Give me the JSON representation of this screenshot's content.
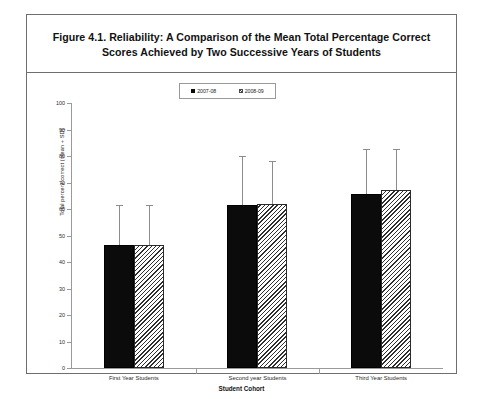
{
  "figure": {
    "title": "Figure 4.1.  Reliability: A Comparison of the Mean Total Percentage Correct Scores Achieved by Two Successive Years of Students",
    "border_color": "#6e6e6e",
    "background": "#ffffff"
  },
  "chart_data": {
    "type": "bar",
    "title": "Figure 4.1.  Reliability: A Comparison of the Mean Total Percentage Correct Scores Achieved by Two Successive Years of Students",
    "xlabel": "Student Cohort",
    "ylabel": "Total percent correct (mean + SD)",
    "categories": [
      "First Year Students",
      "Second year Students",
      "Third Year Students"
    ],
    "ylim": [
      0,
      100
    ],
    "yticks": [
      0,
      10,
      20,
      30,
      40,
      50,
      60,
      70,
      80,
      90,
      100
    ],
    "ytick_labels": [
      "0",
      "10",
      "20",
      "30",
      "40",
      "50",
      "60",
      "70",
      "80",
      "90",
      "100"
    ],
    "grid": false,
    "legend_position": "top-center",
    "error_bars": "SD (upper only)",
    "series": [
      {
        "name": "2007-08",
        "style": "solid-black",
        "color": "#0b0b0b",
        "values": [
          46.5,
          61.5,
          65.5
        ],
        "errors": [
          15.0,
          18.5,
          17.0
        ]
      },
      {
        "name": "2008-09",
        "style": "diagonal-hatch",
        "color": "#ffffff",
        "values": [
          46.5,
          62.0,
          67.0
        ],
        "errors": [
          15.0,
          16.0,
          15.5
        ]
      }
    ]
  }
}
